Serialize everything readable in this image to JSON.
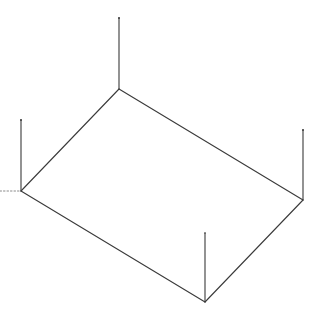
{
  "diagram": {
    "type": "isometric-wireframe",
    "stroke_color": "#3a3a3a",
    "background": "#ffffff",
    "corners": {
      "top": {
        "x": 119,
        "y": 89,
        "post_top_y": 18
      },
      "left": {
        "x": 21,
        "y": 191,
        "post_top_y": 120
      },
      "right": {
        "x": 303,
        "y": 200,
        "post_top_y": 130
      },
      "bottom": {
        "x": 205,
        "y": 302,
        "post_top_y": 233
      }
    },
    "dotted_stub": {
      "x1": 0,
      "y1": 191,
      "x2": 21,
      "y2": 191
    }
  }
}
